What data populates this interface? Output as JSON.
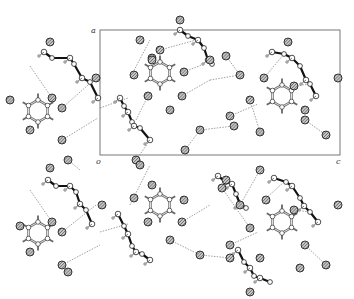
{
  "figure": {
    "type": "crystal packing diagram",
    "unit_cell": {
      "x": 100,
      "y": 30,
      "w": 240,
      "h": 125
    },
    "axis_labels": {
      "origin": "o",
      "a": "a",
      "c": "c"
    },
    "colors": {
      "oxygen_fill": "#8a8a8a",
      "bond_heavy": "#111111",
      "ring_bond": "#666666",
      "hbond": "#777777",
      "cell": "#555555"
    },
    "rings": [
      {
        "cx": 38,
        "cy": 111
      },
      {
        "cx": 160,
        "cy": 73
      },
      {
        "cx": 282,
        "cy": 96
      },
      {
        "cx": 38,
        "cy": 233
      },
      {
        "cx": 160,
        "cy": 205
      },
      {
        "cx": 282,
        "cy": 222
      }
    ],
    "chains": [
      {
        "points": [
          [
            44,
            52
          ],
          [
            52,
            58
          ],
          [
            70,
            58
          ],
          [
            74,
            64
          ],
          [
            82,
            78
          ],
          [
            90,
            82
          ],
          [
            98,
            98
          ]
        ]
      },
      {
        "points": [
          [
            120,
            98
          ],
          [
            124,
            106
          ],
          [
            128,
            112
          ],
          [
            132,
            122
          ],
          [
            134,
            126
          ],
          [
            140,
            128
          ],
          [
            150,
            140
          ]
        ]
      },
      {
        "points": [
          [
            180,
            30
          ],
          [
            188,
            36
          ],
          [
            198,
            40
          ],
          [
            204,
            48
          ],
          [
            208,
            60
          ],
          [
            212,
            64
          ]
        ]
      },
      {
        "points": [
          [
            272,
            52
          ],
          [
            284,
            54
          ],
          [
            292,
            58
          ],
          [
            300,
            66
          ],
          [
            306,
            80
          ],
          [
            310,
            84
          ],
          [
            316,
            96
          ]
        ]
      },
      {
        "points": [
          [
            48,
            180
          ],
          [
            56,
            186
          ],
          [
            70,
            186
          ],
          [
            76,
            192
          ],
          [
            80,
            204
          ],
          [
            86,
            210
          ],
          [
            92,
            224
          ]
        ]
      },
      {
        "points": [
          [
            118,
            214
          ],
          [
            124,
            226
          ],
          [
            128,
            234
          ],
          [
            132,
            246
          ],
          [
            136,
            252
          ],
          [
            142,
            254
          ],
          [
            150,
            260
          ]
        ]
      },
      {
        "points": [
          [
            218,
            176
          ],
          [
            226,
            182
          ],
          [
            232,
            184
          ],
          [
            236,
            194
          ],
          [
            240,
            204
          ],
          [
            246,
            208
          ]
        ]
      },
      {
        "points": [
          [
            274,
            178
          ],
          [
            286,
            182
          ],
          [
            292,
            186
          ],
          [
            300,
            198
          ],
          [
            304,
            206
          ],
          [
            310,
            212
          ],
          [
            318,
            222
          ]
        ]
      },
      {
        "points": [
          [
            238,
            250
          ],
          [
            244,
            262
          ],
          [
            250,
            268
          ],
          [
            254,
            276
          ],
          [
            260,
            278
          ],
          [
            270,
            282
          ]
        ]
      }
    ],
    "oxygens": [
      [
        50,
        42
      ],
      [
        10,
        100
      ],
      [
        52,
        98
      ],
      [
        62,
        108
      ],
      [
        30,
        130
      ],
      [
        62,
        140
      ],
      [
        68,
        160
      ],
      [
        96,
        78
      ],
      [
        140,
        40
      ],
      [
        152,
        58
      ],
      [
        160,
        50
      ],
      [
        134,
        75
      ],
      [
        184,
        72
      ],
      [
        148,
        96
      ],
      [
        182,
        96
      ],
      [
        170,
        110
      ],
      [
        210,
        60
      ],
      [
        152,
        60
      ],
      [
        180,
        20
      ],
      [
        226,
        56
      ],
      [
        240,
        75
      ],
      [
        250,
        100
      ],
      [
        230,
        116
      ],
      [
        234,
        126
      ],
      [
        200,
        130
      ],
      [
        185,
        150
      ],
      [
        136,
        160
      ],
      [
        288,
        42
      ],
      [
        264,
        78
      ],
      [
        294,
        86
      ],
      [
        305,
        120
      ],
      [
        260,
        132
      ],
      [
        305,
        110
      ],
      [
        338,
        78
      ],
      [
        326,
        135
      ],
      [
        50,
        168
      ],
      [
        20,
        226
      ],
      [
        52,
        222
      ],
      [
        62,
        232
      ],
      [
        30,
        252
      ],
      [
        62,
        265
      ],
      [
        68,
        272
      ],
      [
        102,
        205
      ],
      [
        140,
        165
      ],
      [
        152,
        185
      ],
      [
        134,
        198
      ],
      [
        184,
        200
      ],
      [
        148,
        222
      ],
      [
        182,
        222
      ],
      [
        170,
        240
      ],
      [
        222,
        188
      ],
      [
        226,
        180
      ],
      [
        240,
        205
      ],
      [
        250,
        228
      ],
      [
        230,
        245
      ],
      [
        230,
        258
      ],
      [
        200,
        255
      ],
      [
        260,
        170
      ],
      [
        266,
        200
      ],
      [
        294,
        210
      ],
      [
        305,
        245
      ],
      [
        260,
        258
      ],
      [
        338,
        205
      ],
      [
        326,
        265
      ],
      [
        250,
        292
      ],
      [
        300,
        268
      ]
    ],
    "hbonds": [
      [
        [
          30,
          66
        ],
        [
          52,
          98
        ]
      ],
      [
        [
          62,
          108
        ],
        [
          96,
          78
        ]
      ],
      [
        [
          62,
          140
        ],
        [
          98,
          118
        ]
      ],
      [
        [
          68,
          160
        ],
        [
          80,
          170
        ]
      ],
      [
        [
          100,
          108
        ],
        [
          128,
          98
        ]
      ],
      [
        [
          130,
          78
        ],
        [
          150,
          40
        ]
      ],
      [
        [
          160,
          50
        ],
        [
          196,
          40
        ]
      ],
      [
        [
          184,
          72
        ],
        [
          204,
          64
        ]
      ],
      [
        [
          182,
          96
        ],
        [
          210,
          80
        ]
      ],
      [
        [
          210,
          80
        ],
        [
          240,
          75
        ]
      ],
      [
        [
          226,
          56
        ],
        [
          240,
          75
        ]
      ],
      [
        [
          250,
          100
        ],
        [
          260,
          132
        ]
      ],
      [
        [
          200,
          130
        ],
        [
          234,
          126
        ]
      ],
      [
        [
          185,
          150
        ],
        [
          200,
          130
        ]
      ],
      [
        [
          148,
          96
        ],
        [
          136,
          120
        ]
      ],
      [
        [
          136,
          160
        ],
        [
          150,
          140
        ]
      ],
      [
        [
          264,
          78
        ],
        [
          284,
          54
        ]
      ],
      [
        [
          294,
          86
        ],
        [
          310,
          84
        ]
      ],
      [
        [
          305,
          120
        ],
        [
          326,
          135
        ]
      ],
      [
        [
          230,
          116
        ],
        [
          258,
          104
        ]
      ],
      [
        [
          30,
          190
        ],
        [
          52,
          222
        ]
      ],
      [
        [
          62,
          232
        ],
        [
          96,
          205
        ]
      ],
      [
        [
          62,
          265
        ],
        [
          100,
          245
        ]
      ],
      [
        [
          100,
          232
        ],
        [
          128,
          224
        ]
      ],
      [
        [
          130,
          205
        ],
        [
          150,
          165
        ]
      ],
      [
        [
          182,
          222
        ],
        [
          210,
          205
        ]
      ],
      [
        [
          222,
          188
        ],
        [
          250,
          228
        ]
      ],
      [
        [
          230,
          245
        ],
        [
          258,
          232
        ]
      ],
      [
        [
          200,
          255
        ],
        [
          230,
          258
        ]
      ],
      [
        [
          264,
          200
        ],
        [
          284,
          182
        ]
      ],
      [
        [
          294,
          210
        ],
        [
          310,
          212
        ]
      ],
      [
        [
          305,
          245
        ],
        [
          326,
          265
        ]
      ],
      [
        [
          170,
          240
        ],
        [
          200,
          255
        ]
      ],
      [
        [
          240,
          205
        ],
        [
          260,
          170
        ]
      ]
    ]
  }
}
